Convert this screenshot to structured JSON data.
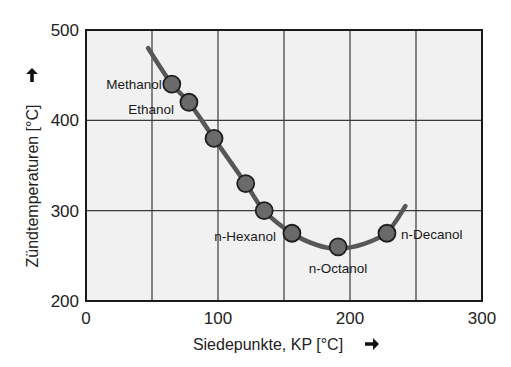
{
  "chart_data": {
    "type": "scatter",
    "title": "",
    "xlabel": "Siedepunkte, KP [°C]",
    "ylabel": "Zündtemperaturen [°C]",
    "xlabel_arrow": "arrow-right",
    "ylabel_arrow": "arrow-up",
    "xlim": [
      0,
      300
    ],
    "ylim": [
      200,
      500
    ],
    "xticks": [
      0,
      100,
      200,
      300
    ],
    "yticks": [
      200,
      300,
      400,
      500
    ],
    "x_gridlines": [
      50,
      100,
      150,
      200,
      250
    ],
    "y_gridlines": [
      300,
      400
    ],
    "grid": true,
    "legend": null,
    "plot_background": "#f1f1f1",
    "curve_color": "#575757",
    "marker_fill": "#6a6a6a",
    "marker_stroke": "#1e1e1e",
    "points": [
      {
        "x": 65,
        "y": 440,
        "label": "Methanol"
      },
      {
        "x": 78,
        "y": 420,
        "label": "Ethanol"
      },
      {
        "x": 97,
        "y": 380,
        "label": ""
      },
      {
        "x": 121,
        "y": 330,
        "label": ""
      },
      {
        "x": 135,
        "y": 300,
        "label": ""
      },
      {
        "x": 156,
        "y": 275,
        "label": "n-Hexanol"
      },
      {
        "x": 191,
        "y": 260,
        "label": "n-Octanol"
      },
      {
        "x": 228,
        "y": 275,
        "label": "n-Decanol"
      }
    ],
    "trend_curve": [
      {
        "x": 47,
        "y": 480
      },
      {
        "x": 65,
        "y": 440
      },
      {
        "x": 78,
        "y": 420
      },
      {
        "x": 97,
        "y": 380
      },
      {
        "x": 121,
        "y": 330
      },
      {
        "x": 135,
        "y": 300
      },
      {
        "x": 156,
        "y": 275
      },
      {
        "x": 175,
        "y": 262
      },
      {
        "x": 191,
        "y": 258
      },
      {
        "x": 210,
        "y": 263
      },
      {
        "x": 228,
        "y": 276
      },
      {
        "x": 242,
        "y": 305
      }
    ],
    "label_positions": {
      "Methanol": {
        "anchor": "end",
        "dx": -10,
        "dy": 5
      },
      "Ethanol": {
        "anchor": "end",
        "dx": -15,
        "dy": 12
      },
      "n-Hexanol": {
        "anchor": "end",
        "dx": -16,
        "dy": 8
      },
      "n-Octanol": {
        "anchor": "middle",
        "dx": 0,
        "dy": 26
      },
      "n-Decanol": {
        "anchor": "start",
        "dx": 14,
        "dy": 6
      }
    }
  }
}
